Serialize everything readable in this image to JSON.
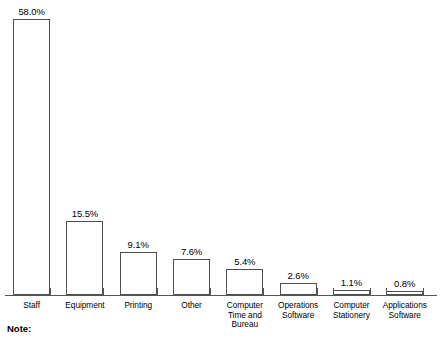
{
  "note": {
    "label": "Note:"
  },
  "chart_data": {
    "type": "bar",
    "title": "",
    "subtitle": "",
    "xlabel": "",
    "ylabel": "",
    "ylim": [
      0,
      58.0
    ],
    "grid": false,
    "legend": false,
    "value_suffix": "%",
    "categories": [
      "Staff",
      "Equipment",
      "Printing",
      "Other",
      "Computer Time and Bureau",
      "Operations Software",
      "Computer Stationery",
      "Applications Software"
    ],
    "category_lines": [
      [
        "Staff"
      ],
      [
        "Equipment"
      ],
      [
        "Printing"
      ],
      [
        "Other"
      ],
      [
        "Computer",
        "Time and",
        "Bureau"
      ],
      [
        "Operations",
        "Software"
      ],
      [
        "Computer",
        "Stationery"
      ],
      [
        "Applications",
        "Software"
      ]
    ],
    "values": [
      58.0,
      15.5,
      9.1,
      7.6,
      5.4,
      2.6,
      1.1,
      0.8
    ],
    "value_labels": [
      "58.0%",
      "15.5%",
      "9.1%",
      "7.6%",
      "5.4%",
      "2.6%",
      "1.1%",
      "0.8%"
    ],
    "bar_fill": "#ffffff",
    "bar_stroke": "#4d4d4d",
    "axis_color": "#555555",
    "background": "#ffffff"
  }
}
